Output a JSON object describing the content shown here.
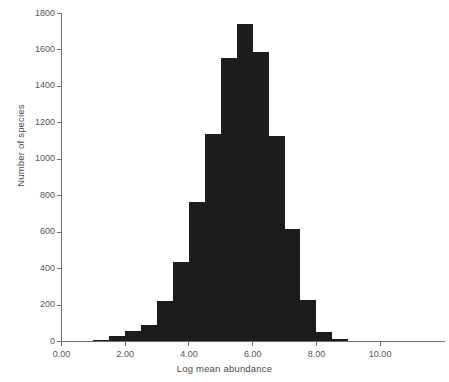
{
  "chart_data": {
    "type": "bar",
    "title": "",
    "subtitle": "",
    "xlabel": "Log mean abundance",
    "ylabel": "Number of species",
    "xlim": [
      0.0,
      11.0
    ],
    "ylim": [
      0,
      1800
    ],
    "xticks": [
      0.0,
      2.0,
      4.0,
      6.0,
      8.0,
      10.0
    ],
    "xtick_labels": [
      "0.00",
      "2.00",
      "4.00",
      "6.00",
      "8.00",
      "10.00"
    ],
    "yticks": [
      0,
      200,
      400,
      600,
      800,
      1000,
      1200,
      1400,
      1600,
      1800
    ],
    "ytick_labels": [
      "0",
      "200",
      "400",
      "600",
      "800",
      "1000",
      "1200",
      "1400",
      "1600",
      "1800"
    ],
    "grid": false,
    "legend": false,
    "bin_width": 0.5,
    "bar_color": "#1c1c1c",
    "axis_color": "#6e6e6e",
    "bins": [
      {
        "x0": 1.0,
        "x1": 1.5,
        "value": 10
      },
      {
        "x0": 1.5,
        "x1": 2.0,
        "value": 28
      },
      {
        "x0": 2.0,
        "x1": 2.5,
        "value": 58
      },
      {
        "x0": 2.5,
        "x1": 3.0,
        "value": 90
      },
      {
        "x0": 3.0,
        "x1": 3.5,
        "value": 225
      },
      {
        "x0": 3.5,
        "x1": 4.0,
        "value": 435
      },
      {
        "x0": 4.0,
        "x1": 4.5,
        "value": 765
      },
      {
        "x0": 4.5,
        "x1": 5.0,
        "value": 1140
      },
      {
        "x0": 5.0,
        "x1": 5.5,
        "value": 1555
      },
      {
        "x0": 5.5,
        "x1": 6.0,
        "value": 1740
      },
      {
        "x0": 6.0,
        "x1": 6.5,
        "value": 1590
      },
      {
        "x0": 6.5,
        "x1": 7.0,
        "value": 1130
      },
      {
        "x0": 7.0,
        "x1": 7.5,
        "value": 615
      },
      {
        "x0": 7.5,
        "x1": 8.0,
        "value": 230
      },
      {
        "x0": 8.0,
        "x1": 8.5,
        "value": 50
      },
      {
        "x0": 8.5,
        "x1": 9.0,
        "value": 12
      }
    ],
    "categories": [
      "1.0-1.5",
      "1.5-2.0",
      "2.0-2.5",
      "2.5-3.0",
      "3.0-3.5",
      "3.5-4.0",
      "4.0-4.5",
      "4.5-5.0",
      "5.0-5.5",
      "5.5-6.0",
      "6.0-6.5",
      "6.5-7.0",
      "7.0-7.5",
      "7.5-8.0",
      "8.0-8.5",
      "8.5-9.0"
    ],
    "values": [
      10,
      28,
      58,
      90,
      225,
      435,
      765,
      1140,
      1555,
      1740,
      1590,
      1130,
      615,
      230,
      50,
      12
    ]
  }
}
